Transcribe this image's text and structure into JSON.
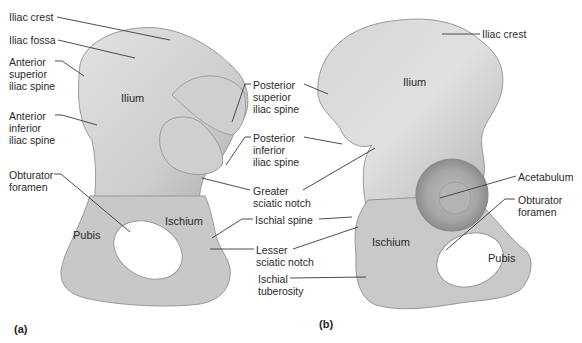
{
  "figure": {
    "panels": [
      {
        "id": "a",
        "label": "(a)",
        "view": "medial"
      },
      {
        "id": "b",
        "label": "(b)",
        "view": "lateral"
      }
    ],
    "colors": {
      "bone_light": "#dadada",
      "bone_mid": "#c4c4c4",
      "bone_dark": "#9a9a9a",
      "leader_line": "#3a3a3a",
      "text": "#2a2a2a"
    }
  },
  "panel_a": {
    "panel_label": "(a)",
    "regions": {
      "ilium": "Ilium",
      "ischium": "Ischium",
      "pubis": "Pubis"
    },
    "labels": {
      "iliac_crest": "Iliac crest",
      "iliac_fossa": "Iliac fossa",
      "anterior_superior_iliac_spine": "Anterior\nsuperior\niliac spine",
      "anterior_inferior_iliac_spine": "Anterior\ninferior\niliac spine",
      "obturator_foramen": "Obturator\nforamen"
    }
  },
  "shared_labels": {
    "posterior_superior_iliac_spine": "Posterior\nsuperior\niliac spine",
    "posterior_inferior_iliac_spine": "Posterior\ninferior\niliac spine",
    "greater_sciatic_notch": "Greater\nsciatic notch",
    "ischial_spine": "Ischial spine",
    "lesser_sciatic_notch": "Lesser\nsciatic notch",
    "ischial_tuberosity": "Ischial\ntuberosity"
  },
  "panel_b": {
    "panel_label": "(b)",
    "regions": {
      "ilium": "Ilium",
      "ischium": "Ischium",
      "pubis": "Pubis"
    },
    "labels": {
      "iliac_crest": "Iliac crest",
      "acetabulum": "Acetabulum",
      "obturator_foramen": "Obturator\nforamen"
    }
  }
}
